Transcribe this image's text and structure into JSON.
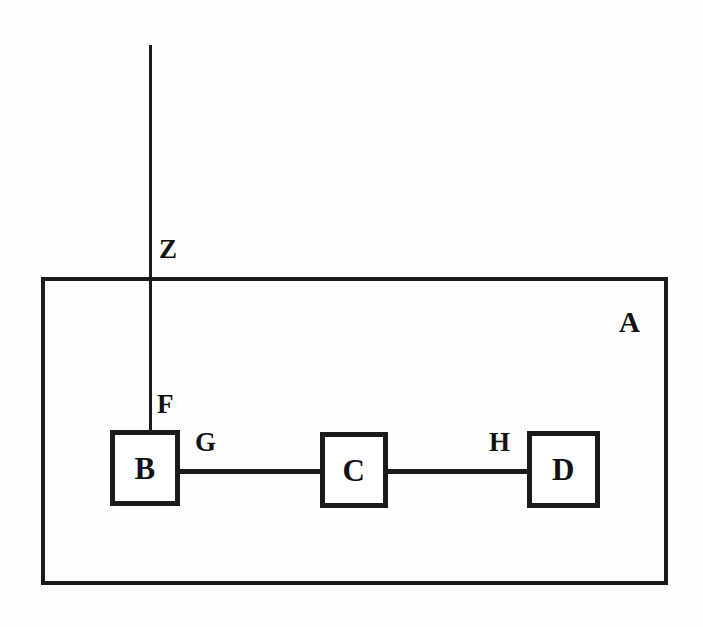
{
  "diagram": {
    "background_color": "#fefefe",
    "ink_color": "#1b1b1b",
    "enclosure": {
      "label": "A",
      "label_x": 619,
      "label_y": 308,
      "x": 41,
      "y": 277,
      "width": 627,
      "height": 308,
      "border_width": 4
    },
    "boxes": [
      {
        "label": "B",
        "x": 110,
        "y": 430,
        "width": 70,
        "height": 76,
        "border_width": 5
      },
      {
        "label": "C",
        "x": 320,
        "y": 432,
        "width": 68,
        "height": 76,
        "border_width": 5
      },
      {
        "label": "D",
        "x": 527,
        "y": 431,
        "width": 73,
        "height": 77,
        "border_width": 5
      }
    ],
    "wires": [
      {
        "name": "vertical-trunk-into-b",
        "orientation": "vertical",
        "x": 149,
        "y": 45,
        "length": 387,
        "thickness": 3
      },
      {
        "name": "b-to-c-link",
        "orientation": "horizontal",
        "x": 178,
        "y": 469,
        "length": 144,
        "thickness": 5
      },
      {
        "name": "c-to-d-link",
        "orientation": "horizontal",
        "x": 386,
        "y": 469,
        "length": 143,
        "thickness": 5
      }
    ],
    "tags": [
      {
        "label": "Z",
        "x": 159,
        "y": 236,
        "size": "normal"
      },
      {
        "label": "F",
        "x": 157,
        "y": 391,
        "size": "normal"
      },
      {
        "label": "G",
        "x": 195,
        "y": 429,
        "size": "normal"
      },
      {
        "label": "H",
        "x": 489,
        "y": 429,
        "size": "normal"
      }
    ]
  }
}
